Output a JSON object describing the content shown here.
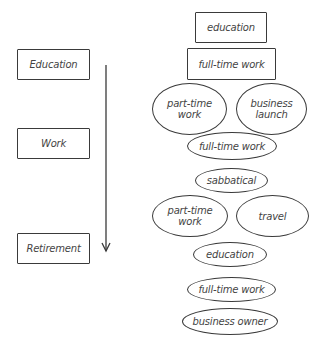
{
  "stages": {
    "label": "Traditional life stages",
    "items": [
      {
        "label": "Education",
        "x": 17,
        "y": 49,
        "w": 73,
        "h": 31
      },
      {
        "label": "Work",
        "x": 17,
        "y": 128,
        "w": 73,
        "h": 31
      },
      {
        "label": "Retirement",
        "x": 17,
        "y": 233,
        "w": 73,
        "h": 31
      }
    ],
    "arrow": {
      "x": 106,
      "y1": 65,
      "y2": 251,
      "color": "#3a3a3a"
    }
  },
  "path": {
    "label": "Multi-stage life path",
    "items": [
      {
        "label": "education",
        "shape": "rect",
        "x": 195,
        "y": 12,
        "w": 72,
        "h": 31
      },
      {
        "label": "full-time work",
        "shape": "rect",
        "x": 187,
        "y": 48,
        "w": 89,
        "h": 32
      },
      {
        "label": "part-time work",
        "shape": "ellipse",
        "x": 152,
        "y": 83,
        "w": 75,
        "h": 52
      },
      {
        "label": "business launch",
        "shape": "ellipse",
        "x": 236,
        "y": 83,
        "w": 71,
        "h": 52
      },
      {
        "label": "full-time work",
        "shape": "ellipse",
        "x": 187,
        "y": 132,
        "w": 90,
        "h": 28
      },
      {
        "label": "sabbatical",
        "shape": "ellipse",
        "x": 195,
        "y": 168,
        "w": 73,
        "h": 25
      },
      {
        "label": "part-time work",
        "shape": "ellipse",
        "x": 152,
        "y": 195,
        "w": 76,
        "h": 42
      },
      {
        "label": "travel",
        "shape": "ellipse",
        "x": 236,
        "y": 195,
        "w": 73,
        "h": 42
      },
      {
        "label": "education",
        "shape": "ellipse",
        "x": 193,
        "y": 242,
        "w": 74,
        "h": 25
      },
      {
        "label": "full-time work",
        "shape": "ellipse",
        "x": 187,
        "y": 277,
        "w": 89,
        "h": 25
      },
      {
        "label": "business owner",
        "shape": "ellipse",
        "x": 182,
        "y": 308,
        "w": 96,
        "h": 27
      }
    ]
  },
  "colors": {
    "stroke": "#3a3a3a",
    "text": "#444444",
    "background": "#ffffff"
  }
}
